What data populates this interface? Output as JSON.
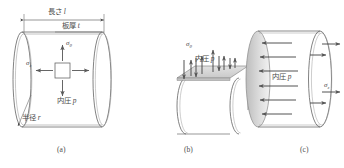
{
  "figure": {
    "background": "#ffffff",
    "line_color": "#6b6b6b",
    "shade_color": "#d4d4d4",
    "text_color": "#4a4a4a"
  },
  "panel_a": {
    "caption": "(a)",
    "labels": {
      "length": "長さ",
      "length_symbol": "l",
      "thickness": "板厚",
      "thickness_symbol": "t",
      "radius": "半径",
      "radius_symbol": "r",
      "pressure": "内圧",
      "pressure_symbol": "p",
      "hoop_stress": "σ",
      "hoop_sub": "θ",
      "axial_stress": "σ",
      "axial_sub": "z"
    }
  },
  "panel_b": {
    "caption": "(b)",
    "labels": {
      "hoop_stress": "σ",
      "hoop_sub": "θ",
      "pressure": "内圧",
      "pressure_symbol": "p"
    },
    "arrow_counts": {
      "pressure_up": 5,
      "stress_down": 4
    }
  },
  "panel_c": {
    "caption": "(c)",
    "labels": {
      "pressure": "内圧",
      "pressure_symbol": "p",
      "axial_stress": "σ",
      "axial_sub": "z"
    },
    "arrow_counts": {
      "pressure_in": 6,
      "stress_out": 3
    }
  }
}
